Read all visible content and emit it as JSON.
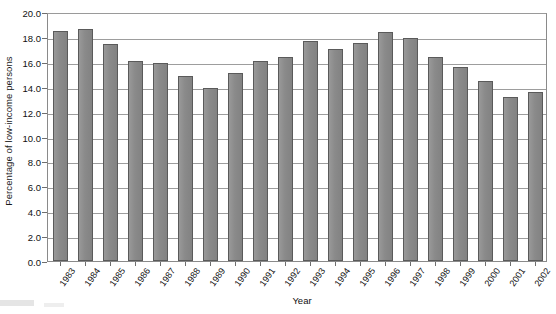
{
  "chart_data": {
    "type": "bar",
    "title": "",
    "xlabel": "Year",
    "ylabel": "Percentage of low-income persons",
    "categories": [
      "1983",
      "1984",
      "1985",
      "1986",
      "1987",
      "1988",
      "1989",
      "1990",
      "1991",
      "1992",
      "1993",
      "1994",
      "1995",
      "1996",
      "1997",
      "1998",
      "1999",
      "2000",
      "2001",
      "2002"
    ],
    "values": [
      18.5,
      18.6,
      17.4,
      16.1,
      15.9,
      14.9,
      13.9,
      15.1,
      16.1,
      16.4,
      17.7,
      17.0,
      17.5,
      18.4,
      17.9,
      16.4,
      15.6,
      14.5,
      13.2,
      13.6
    ],
    "ylim": [
      0.0,
      20.0
    ],
    "ytick_values": [
      0.0,
      2.0,
      4.0,
      6.0,
      8.0,
      10.0,
      12.0,
      14.0,
      16.0,
      18.0,
      20.0
    ],
    "ytick_labels": [
      "0.0",
      "2.0",
      "4.0",
      "6.0",
      "8.0",
      "10.0",
      "12.0",
      "14.0",
      "16.0",
      "18.0",
      "20.0"
    ],
    "grid": true,
    "grid_axis": "y",
    "legend": false,
    "legend_position": "none",
    "bar_color": "#8c8c8c",
    "bar_edge_color": "#5a5a5a",
    "series": [
      {
        "name": "Percentage of low-income persons",
        "values": [
          18.5,
          18.6,
          17.4,
          16.1,
          15.9,
          14.9,
          13.9,
          15.1,
          16.1,
          16.4,
          17.7,
          17.0,
          17.5,
          18.4,
          17.9,
          16.4,
          15.6,
          14.5,
          13.2,
          13.6
        ]
      }
    ]
  },
  "axes": {
    "y_title": "Percentage of low-income persons",
    "x_title": "Year"
  },
  "colors": {
    "bar_fill": "#8c8c8c",
    "bar_stroke": "#5a5a5a",
    "grid": "#9d9d9d",
    "frame": "#8a8a8a",
    "text": "#111111",
    "background": "#ffffff"
  }
}
